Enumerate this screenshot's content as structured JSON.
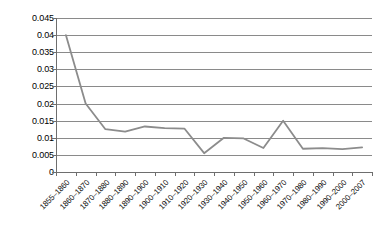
{
  "chart_data": {
    "type": "line",
    "title": "",
    "subtitle": "",
    "xlabel": "",
    "ylabel": "",
    "ylim": [
      0,
      0.045
    ],
    "ytick_values": [
      0,
      0.005,
      0.01,
      0.015,
      0.02,
      0.025,
      0.03,
      0.035,
      0.04,
      0.045
    ],
    "ytick_labels": [
      "0",
      "0.005",
      "0.01",
      "0.015",
      "0.02",
      "0.025",
      "0.03",
      "0.035",
      "0.04",
      "0.045"
    ],
    "grid": true,
    "legend": false,
    "legend_position": "none",
    "categories": [
      "1855–1860",
      "1860–1870",
      "1870–1880",
      "1880–1890",
      "1890–1900",
      "1900–1910",
      "1910–1920",
      "1920–1930",
      "1930–1940",
      "1940–1950",
      "1950–1960",
      "1960–1970",
      "1970–1980",
      "1980–1990",
      "1990–2000",
      "2000–2007"
    ],
    "series": [
      {
        "name": "series-1",
        "color": "#8c8c8c",
        "values": [
          0.04,
          0.02,
          0.0125,
          0.0118,
          0.0133,
          0.0128,
          0.0127,
          0.0055,
          0.01,
          0.0098,
          0.007,
          0.015,
          0.0068,
          0.007,
          0.0067,
          0.0072
        ]
      }
    ]
  },
  "style": {
    "grid_color": "#8a8a8a",
    "axis_color": "#6e6e6e",
    "line_color": "#8c8c8c",
    "background": "#ffffff",
    "text_color": "#000000"
  }
}
